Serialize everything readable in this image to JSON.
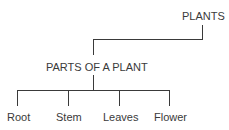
{
  "diagram": {
    "type": "tree",
    "root": {
      "label": "PLANTS"
    },
    "level1": {
      "label": "PARTS OF A PLANT"
    },
    "leaves": [
      {
        "label": "Root"
      },
      {
        "label": "Stem"
      },
      {
        "label": "Leaves"
      },
      {
        "label": "Flower"
      }
    ],
    "line_color": "#3a3a3a"
  }
}
